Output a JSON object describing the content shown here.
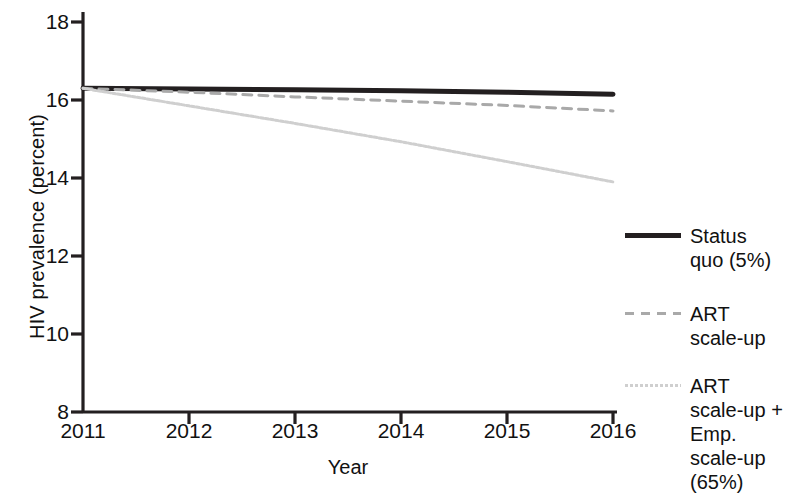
{
  "chart_data": {
    "type": "line",
    "title": "",
    "xlabel": "Year",
    "ylabel": "HIV prevalence (percent)",
    "x": [
      2011,
      2012,
      2013,
      2014,
      2015,
      2016
    ],
    "xticklabels": [
      "2011",
      "2012",
      "2013",
      "2014",
      "2015",
      "2016"
    ],
    "yticklabels": [
      "8",
      "10",
      "12",
      "14",
      "16",
      "18"
    ],
    "yticks": [
      8,
      10,
      12,
      14,
      16,
      18
    ],
    "xlim": [
      2011,
      2016
    ],
    "ylim": [
      8,
      18
    ],
    "grid": false,
    "legend_position": "right",
    "series": [
      {
        "name": "Status quo (5%)",
        "legend_label": "Status\nquo (5%)",
        "style": "solid",
        "color": "#231f20",
        "width": 5,
        "values": [
          16.3,
          16.28,
          16.26,
          16.24,
          16.2,
          16.15
        ]
      },
      {
        "name": "ART scale-up",
        "legend_label": "ART\nscale-up",
        "style": "dashed",
        "color": "#a9a9a9",
        "width": 3,
        "values": [
          16.3,
          16.2,
          16.08,
          15.97,
          15.86,
          15.72
        ]
      },
      {
        "name": "ART scale-up + Emp. scale-up (65%)",
        "legend_label": "ART\nscale-up +\nEmp.\nscale-up\n(65%)",
        "style": "dotted",
        "color": "#cfcfcf",
        "width": 3,
        "values": [
          16.3,
          15.85,
          15.4,
          14.93,
          14.42,
          13.9
        ]
      }
    ]
  },
  "axes": {
    "axis_color": "#231f20"
  }
}
